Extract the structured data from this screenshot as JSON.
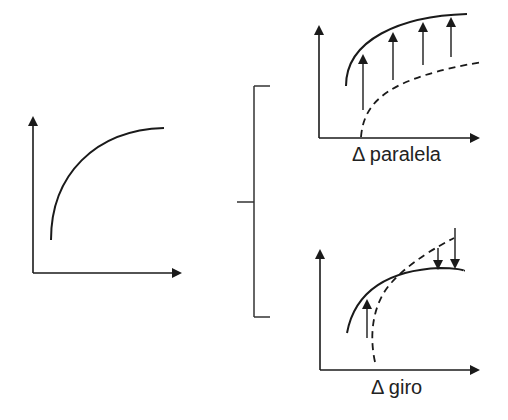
{
  "diagram": {
    "base_graph": {
      "description": "concave increasing curve"
    },
    "bracket": {
      "description": "bracket splitting into two cases"
    },
    "cases": [
      {
        "label": "Δ paralela",
        "description": "parallel upward shift: dashed curve shifted up to solid curve with upward arrows"
      },
      {
        "label": "Δ giro",
        "description": "rotation: dashed curve rotates, upward arrow on left, downward arrows on right"
      }
    ],
    "colors": {
      "stroke": "#1a1a1a",
      "background": "#ffffff"
    }
  }
}
